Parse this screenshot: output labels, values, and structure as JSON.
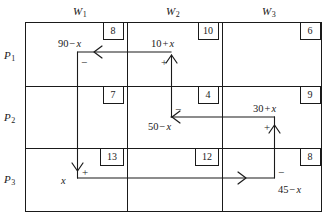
{
  "figure": {
    "type": "transportation-tableau"
  },
  "columns": [
    {
      "id": "w1",
      "label": "W",
      "sub": "1"
    },
    {
      "id": "w2",
      "label": "W",
      "sub": "2"
    },
    {
      "id": "w3",
      "label": "W",
      "sub": "3"
    }
  ],
  "rows": [
    {
      "id": "p1",
      "label": "P",
      "sub": "1"
    },
    {
      "id": "p2",
      "label": "P",
      "sub": "2"
    },
    {
      "id": "p3",
      "label": "P",
      "sub": "3"
    }
  ],
  "costs": {
    "p1w1": "8",
    "p1w2": "10",
    "p1w3": "6",
    "p2w1": "7",
    "p2w2": "4",
    "p2w3": "9",
    "p3w1": "13",
    "p3w2": "12",
    "p3w3": "8"
  },
  "allocations": {
    "p1w1": {
      "num": "90",
      "op": "−",
      "var": "x"
    },
    "p1w2": {
      "num": "10",
      "op": "+",
      "var": "x"
    },
    "p2w2": {
      "num": "50",
      "op": "−",
      "var": "x"
    },
    "p2w3": {
      "num": "30",
      "op": "+",
      "var": "x"
    },
    "p3w1": {
      "num": "",
      "op": "",
      "var": "x"
    },
    "p3w3": {
      "num": "45",
      "op": "−",
      "var": "x"
    }
  },
  "loop_signs": {
    "p1w1": "−",
    "p1w2": "+",
    "p2w2": "−",
    "p2w3": "+",
    "p3w1": "+",
    "p3w3": "−"
  },
  "colors": {
    "line": "#1a1a1a",
    "background": "#ffffff"
  }
}
